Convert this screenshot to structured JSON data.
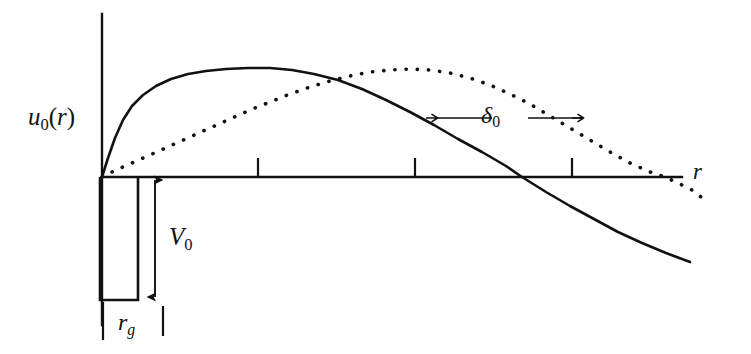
{
  "figure": {
    "title": "",
    "background_color": "#ffffff",
    "ink_color": "#111111"
  },
  "axes": {
    "y_axis": {
      "label": "u",
      "label_sub": "0",
      "label_arg": "(r)",
      "name": "u0(r)"
    },
    "x_axis": {
      "label": "r",
      "name": "r"
    },
    "origin": {
      "x": 102,
      "y": 177
    },
    "x_ticks": [
      258,
      415,
      572
    ],
    "tick_count": 3
  },
  "annotations": {
    "well_depth": {
      "label": "V",
      "label_sub": "0",
      "name": "V0"
    },
    "core_radius": {
      "label": "r",
      "label_sub": "g",
      "name": "r_g"
    },
    "phase_shift": {
      "label": "δ",
      "label_sub": "0",
      "name": "delta_0"
    }
  },
  "chart_data": {
    "type": "line",
    "title": "",
    "xlabel": "r",
    "ylabel": "u₀(r)",
    "grid": false,
    "legend": null,
    "xlim": [
      0,
      1.0
    ],
    "ylim": [
      -0.45,
      0.62
    ],
    "series": [
      {
        "name": "u0-solid-with-core",
        "style": "solid",
        "color": "#111111",
        "width": 2.6,
        "comment": "steeply rising wavefunction, peaks early, crosses axis at r~0.73",
        "points": [
          [
            102,
            177
          ],
          [
            108,
            158
          ],
          [
            115,
            138
          ],
          [
            123,
            120
          ],
          [
            132,
            106
          ],
          [
            143,
            95
          ],
          [
            156,
            86
          ],
          [
            171,
            79
          ],
          [
            188,
            74
          ],
          [
            206,
            71
          ],
          [
            226,
            69
          ],
          [
            248,
            68
          ],
          [
            270,
            68
          ],
          [
            292,
            70
          ],
          [
            314,
            74
          ],
          [
            338,
            80
          ],
          [
            362,
            89
          ],
          [
            386,
            100
          ],
          [
            410,
            112
          ],
          [
            434,
            125
          ],
          [
            458,
            139
          ],
          [
            482,
            152
          ],
          [
            506,
            166
          ],
          [
            522,
            177
          ],
          [
            546,
            192
          ],
          [
            570,
            206
          ],
          [
            594,
            219
          ],
          [
            618,
            232
          ],
          [
            642,
            243
          ],
          [
            666,
            253
          ],
          [
            690,
            262
          ]
        ]
      },
      {
        "name": "u0-dotted-no-core",
        "style": "dotted",
        "color": "#111111",
        "width": 3.6,
        "comment": "gradually rising sine-like wavefunction, peaks later, crosses axis at r~0.98",
        "points": [
          [
            102,
            177
          ],
          [
            116,
            170
          ],
          [
            132,
            163
          ],
          [
            150,
            155
          ],
          [
            170,
            146
          ],
          [
            190,
            137
          ],
          [
            210,
            128
          ],
          [
            230,
            119
          ],
          [
            250,
            110
          ],
          [
            270,
            102
          ],
          [
            290,
            94
          ],
          [
            310,
            87
          ],
          [
            330,
            81
          ],
          [
            350,
            76
          ],
          [
            370,
            72
          ],
          [
            390,
            70
          ],
          [
            410,
            69
          ],
          [
            430,
            70
          ],
          [
            450,
            73
          ],
          [
            470,
            78
          ],
          [
            490,
            85
          ],
          [
            510,
            94
          ],
          [
            530,
            104
          ],
          [
            550,
            116
          ],
          [
            570,
            128
          ],
          [
            590,
            140
          ],
          [
            610,
            152
          ],
          [
            630,
            163
          ],
          [
            650,
            172
          ],
          [
            665,
            177
          ],
          [
            680,
            184
          ],
          [
            692,
            190
          ],
          [
            700,
            196
          ],
          [
            704,
            200
          ]
        ]
      }
    ],
    "potential_well": {
      "name": "square-well",
      "left_x": 100,
      "right_x": 138,
      "top_y": 177,
      "bottom_y": 300,
      "depth_label": "V₀",
      "width_label": "r_g"
    },
    "measure_arrows": [
      {
        "name": "V0-arrow",
        "orientation": "vertical",
        "x": 155,
        "y_start": 177,
        "y_end": 300
      },
      {
        "name": "delta0-arrow",
        "orientation": "horizontal",
        "y": 118,
        "x_start": 437,
        "x_end": 545
      }
    ]
  }
}
